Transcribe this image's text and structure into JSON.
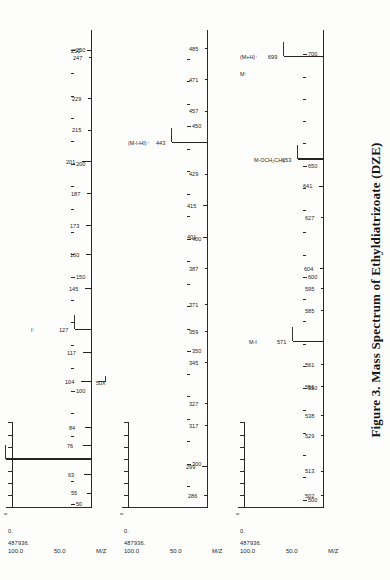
{
  "figure": {
    "caption": "Figure 3.  Mass Spectrum of Ethyldiatrizoate (DZE)",
    "axis_label_mz": "M/Z",
    "intensity_high": "487936.",
    "intensity_low": "0.",
    "y_tick_100": "100.0",
    "y_tick_50": "50.0",
    "break_symbol": "≈"
  },
  "chart_data": {
    "type": "bar",
    "title": "Mass Spectrum of Ethyldiatrizoate (DZE)",
    "xlabel": "M/Z",
    "ylabel": "Relative Intensity (%)",
    "ylim": [
      0,
      100
    ],
    "intensity_full_scale": 487936,
    "panels": [
      {
        "name": "panel-50-250",
        "xlim": [
          50,
          258
        ],
        "ticks_major": [
          50,
          100,
          150,
          200,
          250
        ],
        "ticks_minor": [
          60,
          70,
          80,
          90,
          110,
          120,
          130,
          140,
          160,
          170,
          180,
          190,
          210,
          220,
          230,
          240
        ],
        "labeled_peaks": [
          {
            "mz": 55,
            "intensity": 6
          },
          {
            "mz": 63,
            "intensity": 9
          },
          {
            "mz": 70,
            "intensity": 100,
            "annotation": "(O=C-N=CH)⁺",
            "annotation2": "CH₃"
          },
          {
            "mz": 76,
            "intensity": 11
          },
          {
            "mz": 84,
            "intensity": 8
          },
          {
            "mz": 104,
            "intensity": 13
          },
          {
            "mz": 117,
            "intensity": 10
          },
          {
            "mz": 127,
            "intensity": 20,
            "annotation": "I⁺"
          },
          {
            "mz": 145,
            "intensity": 8
          },
          {
            "mz": 160,
            "intensity": 7
          },
          {
            "mz": 173,
            "intensity": 7
          },
          {
            "mz": 187,
            "intensity": 6
          },
          {
            "mz": 201,
            "intensity": 12
          },
          {
            "mz": 215,
            "intensity": 5
          },
          {
            "mz": 229,
            "intensity": 5
          },
          {
            "mz": 247,
            "intensity": 4
          },
          {
            "mz": 250,
            "intensity": 6
          }
        ]
      },
      {
        "name": "panel-286-485",
        "xlim": [
          282,
          492
        ],
        "ticks_major": [
          300,
          350,
          400,
          450
        ],
        "ticks_minor": [
          290,
          310,
          320,
          330,
          340,
          360,
          370,
          380,
          390,
          410,
          420,
          430,
          440,
          460,
          470,
          480
        ],
        "multiplier": "50X",
        "labeled_peaks": [
          {
            "mz": 286,
            "intensity": 5
          },
          {
            "mz": 299,
            "intensity": 7
          },
          {
            "mz": 317,
            "intensity": 4
          },
          {
            "mz": 327,
            "intensity": 4
          },
          {
            "mz": 345,
            "intensity": 3
          },
          {
            "mz": 359,
            "intensity": 4
          },
          {
            "mz": 371,
            "intensity": 3
          },
          {
            "mz": 387,
            "intensity": 4
          },
          {
            "mz": 401,
            "intensity": 6
          },
          {
            "mz": 415,
            "intensity": 6
          },
          {
            "mz": 429,
            "intensity": 4
          },
          {
            "mz": 443,
            "intensity": 42,
            "annotation": "(M-I-HI)⁺"
          },
          {
            "mz": 457,
            "intensity": 4
          },
          {
            "mz": 471,
            "intensity": 3
          },
          {
            "mz": 485,
            "intensity": 4
          }
        ]
      },
      {
        "name": "panel-502-700",
        "xlim": [
          498,
          710
        ],
        "ticks_major": [
          500,
          550,
          600,
          650,
          700
        ],
        "ticks_minor": [
          510,
          520,
          530,
          540,
          560,
          570,
          580,
          590,
          610,
          620,
          630,
          640,
          660,
          670,
          680,
          690
        ],
        "labeled_peaks": [
          {
            "mz": 502,
            "intensity": 4
          },
          {
            "mz": 513,
            "intensity": 4
          },
          {
            "mz": 529,
            "intensity": 3
          },
          {
            "mz": 538,
            "intensity": 4
          },
          {
            "mz": 551,
            "intensity": 3
          },
          {
            "mz": 561,
            "intensity": 3
          },
          {
            "mz": 571,
            "intensity": 36,
            "annotation": "M-I"
          },
          {
            "mz": 585,
            "intensity": 4
          },
          {
            "mz": 595,
            "intensity": 4
          },
          {
            "mz": 604,
            "intensity": 5
          },
          {
            "mz": 627,
            "intensity": 4
          },
          {
            "mz": 641,
            "intensity": 6
          },
          {
            "mz": 653,
            "intensity": 30,
            "annotation": "M-OCH₂CH₃"
          },
          {
            "mz": 699,
            "intensity": 46,
            "annotation": "(M+H)⁺",
            "annotation2": "M⁺"
          }
        ]
      }
    ]
  }
}
